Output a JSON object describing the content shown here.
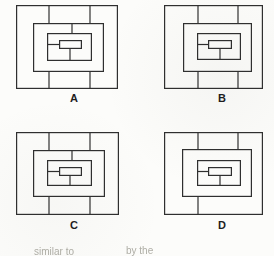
{
  "puzzle": {
    "type": "nested-rectangles-option-set",
    "option_count": 4
  },
  "colors": {
    "line": "#2f2f2f",
    "background": "#fcfcfa",
    "label_text": "#1e1e1e",
    "footer_text": "#a09f96"
  },
  "footer": {
    "fragments": [
      "similar to",
      "by the"
    ]
  },
  "figures": [
    {
      "label": "A",
      "size": [
        102,
        84
      ],
      "rects": [
        [
          0,
          0,
          102,
          84
        ],
        [
          17,
          18,
          71,
          49
        ],
        [
          31,
          28,
          45,
          28
        ],
        [
          43,
          35,
          23,
          9
        ]
      ],
      "lines": [
        [
          33,
          0,
          33,
          18
        ],
        [
          74,
          0,
          74,
          18
        ],
        [
          33,
          67,
          33,
          84
        ],
        [
          74,
          67,
          74,
          84
        ],
        [
          56,
          18,
          56,
          28
        ],
        [
          31,
          39.5,
          43,
          39.5
        ],
        [
          54,
          44,
          54,
          56
        ]
      ]
    },
    {
      "label": "B",
      "size": [
        99,
        84
      ],
      "rects": [
        [
          0,
          0,
          99,
          84
        ],
        [
          19,
          18,
          69,
          49
        ],
        [
          33,
          28,
          44,
          27
        ],
        [
          44,
          35,
          24,
          9
        ]
      ],
      "lines": [
        [
          34,
          0,
          34,
          18
        ],
        [
          74,
          0,
          74,
          18
        ],
        [
          34,
          67,
          34,
          84
        ],
        [
          74,
          67,
          74,
          84
        ],
        [
          33,
          39.5,
          44,
          39.5
        ],
        [
          56,
          44,
          56,
          55
        ]
      ]
    },
    {
      "label": "C",
      "size": [
        103,
        83
      ],
      "rects": [
        [
          0,
          0,
          103,
          83
        ],
        [
          17,
          18,
          72,
          47
        ],
        [
          31,
          28,
          45,
          26
        ],
        [
          43,
          35,
          23,
          9
        ]
      ],
      "lines": [
        [
          33,
          0,
          33,
          18
        ],
        [
          74,
          0,
          74,
          18
        ],
        [
          33,
          65,
          33,
          83
        ],
        [
          74,
          65,
          74,
          83
        ],
        [
          56,
          18,
          56,
          28
        ],
        [
          31,
          39.5,
          43,
          39.5
        ],
        [
          54,
          44,
          54,
          54
        ]
      ]
    },
    {
      "label": "D",
      "size": [
        99,
        83
      ],
      "rects": [
        [
          0,
          0,
          99,
          83
        ],
        [
          18,
          17,
          70,
          48
        ],
        [
          33,
          28,
          44,
          26
        ],
        [
          44,
          35,
          24,
          9
        ]
      ],
      "lines": [
        [
          34,
          0,
          34,
          17
        ],
        [
          74,
          0,
          74,
          17
        ],
        [
          34,
          65,
          34,
          83
        ],
        [
          33,
          39.5,
          44,
          39.5
        ],
        [
          56,
          44,
          56,
          54
        ]
      ]
    }
  ]
}
